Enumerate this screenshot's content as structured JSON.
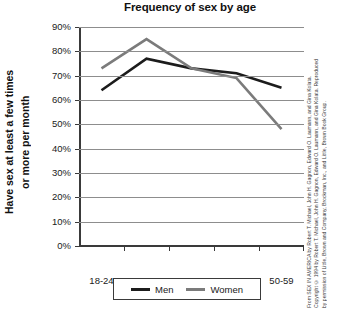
{
  "chart_data": {
    "type": "line",
    "title": "Frequency of sex by age",
    "xlabel": "",
    "ylabel": "Have sex at least a few times or more per month",
    "ylabel_line1": "Have sex at least a few times",
    "ylabel_line2": "or more per month",
    "categories": [
      "18-24",
      "25-29",
      "30-39",
      "40-49",
      "50-59"
    ],
    "ylim": [
      0,
      90
    ],
    "ytick_labels": [
      "0%",
      "10%",
      "20%",
      "30%",
      "40%",
      "50%",
      "60%",
      "70%",
      "80%",
      "90%"
    ],
    "ytick_values": [
      0,
      10,
      20,
      30,
      40,
      50,
      60,
      70,
      80,
      90
    ],
    "grid": true,
    "legend_position": "bottom",
    "series": [
      {
        "name": "Men",
        "color": "#1c1c1c",
        "values": [
          64,
          77,
          73,
          71,
          65
        ]
      },
      {
        "name": "Women",
        "color": "#7b7b7b",
        "values": [
          73,
          85,
          73,
          69,
          48
        ]
      }
    ]
  },
  "legend": {
    "items": [
      {
        "label": "Men",
        "color": "#1c1c1c"
      },
      {
        "label": "Women",
        "color": "#7b7b7b"
      }
    ]
  },
  "credit": {
    "text": "From SEX IN AMERICA by Robert T. Michael, John H. Gagnon, Edward O. Laumann, and Gina Kolata. Copyright © 1994 by Robert T. Michael, John H. Gagnon, Edward O. Laumann, and Gina Kolata. Reproduced by permission of Little, Brown and Company, Brockman, Inc., and Little, Brown Book Group."
  }
}
